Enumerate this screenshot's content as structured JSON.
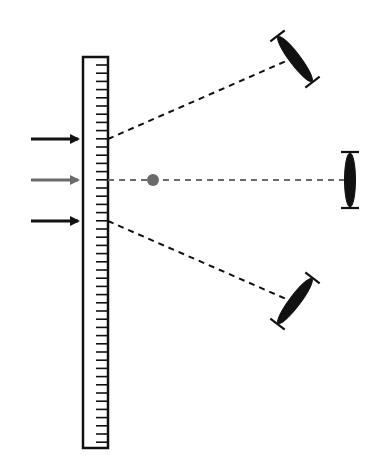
{
  "diagram": {
    "colors": {
      "ink": "#111111",
      "gray": "#6b6b6b",
      "background": "#ffffff"
    },
    "scale": {
      "x": 83,
      "y": 57,
      "width": 25,
      "height": 391,
      "tick_start": 65,
      "tick_spacing": 8.2,
      "tick_length": 12
    },
    "arrows": [
      {
        "name": "arrow-top",
        "y": 139,
        "color": "ink"
      },
      {
        "name": "arrow-middle",
        "y": 180,
        "color": "gray"
      },
      {
        "name": "arrow-bottom",
        "y": 221,
        "color": "ink"
      }
    ],
    "focal_point": {
      "x": 153,
      "y": 180
    },
    "beams": [
      {
        "name": "beam-upper",
        "from": [
          108,
          139
        ],
        "to": [
          293,
          58
        ],
        "color": "ink"
      },
      {
        "name": "beam-middle",
        "from": [
          108,
          180
        ],
        "to": [
          346,
          180
        ],
        "color": "gray"
      },
      {
        "name": "beam-lower",
        "from": [
          108,
          221
        ],
        "to": [
          293,
          302
        ],
        "color": "ink"
      }
    ],
    "lenses": [
      {
        "name": "lens-top",
        "cx": 295,
        "cy": 59,
        "angle": 53
      },
      {
        "name": "lens-right",
        "cx": 350,
        "cy": 180,
        "angle": 90
      },
      {
        "name": "lens-bottom",
        "cx": 295,
        "cy": 301,
        "angle": -53
      }
    ]
  }
}
